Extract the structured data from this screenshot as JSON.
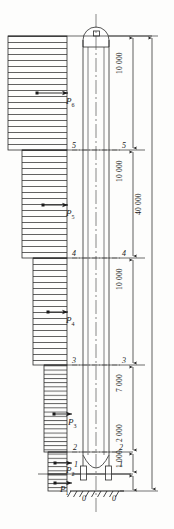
{
  "drawing": {
    "title": "Chimney wind load distribution and elevation dimensions",
    "units_note": "mm",
    "stroke_color": "#2b2b2b",
    "hatch_color": "#3a3a3a"
  },
  "loads": [
    {
      "id": "P1",
      "base": "P",
      "sub": "1"
    },
    {
      "id": "P2",
      "base": "P",
      "sub": "2"
    },
    {
      "id": "P3",
      "base": "P",
      "sub": "3"
    },
    {
      "id": "P4",
      "base": "P",
      "sub": "4"
    },
    {
      "id": "P5",
      "base": "P",
      "sub": "5"
    },
    {
      "id": "P6",
      "base": "P",
      "sub": "6"
    }
  ],
  "sections": [
    {
      "label": "5",
      "side": "left"
    },
    {
      "label": "5",
      "side": "right"
    },
    {
      "label": "4",
      "side": "left"
    },
    {
      "label": "4",
      "side": "right"
    },
    {
      "label": "3",
      "side": "left"
    },
    {
      "label": "3",
      "side": "right"
    },
    {
      "label": "2",
      "side": "left"
    },
    {
      "label": "2",
      "side": "right"
    },
    {
      "label": "1",
      "side": "left"
    },
    {
      "label": "1",
      "side": "right"
    },
    {
      "label": "0",
      "side": "left"
    },
    {
      "label": "0",
      "side": "right"
    }
  ],
  "dimensions": [
    {
      "id": "d-10000-a",
      "value": "10 000"
    },
    {
      "id": "d-10000-b",
      "value": "10 000"
    },
    {
      "id": "d-10000-c",
      "value": "10 000"
    },
    {
      "id": "d-7000",
      "value": "7 000"
    },
    {
      "id": "d-2000",
      "value": "2 000"
    },
    {
      "id": "d-1000",
      "value": "1 000"
    },
    {
      "id": "d-40000",
      "value": "40 000"
    }
  ]
}
